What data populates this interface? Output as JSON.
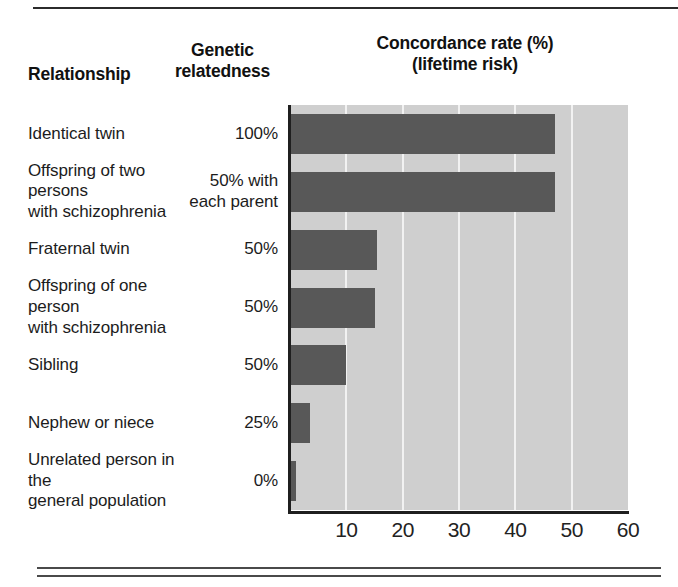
{
  "figure": {
    "headers": {
      "relationship": "Relationship",
      "relatedness_line1": "Genetic",
      "relatedness_line2": "relatedness",
      "title_line1": "Concordance rate (%)",
      "title_line2": "(lifetime risk)"
    },
    "colors": {
      "bar": "#585858",
      "plot_background": "#cfcfcf",
      "gridline": "#f2f2f2",
      "axis": "#1f1f1f",
      "text": "#1c1c1c"
    }
  },
  "chart_data": {
    "type": "bar",
    "orientation": "horizontal",
    "title": "Concordance rate (%) (lifetime risk)",
    "xlabel": "",
    "ylabel": "",
    "xlim": [
      0,
      60
    ],
    "xticks": [
      10,
      20,
      30,
      40,
      50,
      60
    ],
    "grid": true,
    "legend": null,
    "categories": [
      "Identical twin",
      "Offspring of two persons with schizophrenia",
      "Fraternal twin",
      "Offspring of one person with schizophrenia",
      "Sibling",
      "Nephew or niece",
      "Unrelated person in the general population"
    ],
    "values": [
      47,
      47,
      15.5,
      15,
      10,
      3.5,
      1
    ],
    "extra_column": {
      "header": "Genetic relatedness",
      "values": [
        "100%",
        "50% with each parent",
        "50%",
        "50%",
        "50%",
        "25%",
        "0%"
      ]
    },
    "rows": [
      {
        "name_line1": "Identical twin",
        "name_line2": "",
        "relatedness_line1": "100%",
        "relatedness_line2": "",
        "value": 47
      },
      {
        "name_line1": "Offspring of two persons",
        "name_line2": "with schizophrenia",
        "relatedness_line1": "50% with",
        "relatedness_line2": "each parent",
        "value": 47
      },
      {
        "name_line1": "Fraternal twin",
        "name_line2": "",
        "relatedness_line1": "50%",
        "relatedness_line2": "",
        "value": 15.5
      },
      {
        "name_line1": "Offspring of one person",
        "name_line2": "with schizophrenia",
        "relatedness_line1": "50%",
        "relatedness_line2": "",
        "value": 15
      },
      {
        "name_line1": "Sibling",
        "name_line2": "",
        "relatedness_line1": "50%",
        "relatedness_line2": "",
        "value": 10
      },
      {
        "name_line1": "Nephew or niece",
        "name_line2": "",
        "relatedness_line1": "25%",
        "relatedness_line2": "",
        "value": 3.5
      },
      {
        "name_line1": "Unrelated person in the",
        "name_line2": "general population",
        "relatedness_line1": "0%",
        "relatedness_line2": "",
        "value": 1
      }
    ]
  }
}
